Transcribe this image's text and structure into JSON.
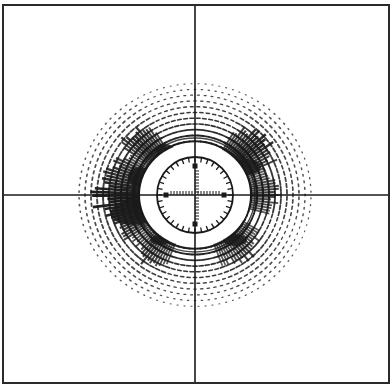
{
  "figure": {
    "colors": {
      "background": "#ffffff",
      "ink": "#1a1a1a",
      "frame": "#2a2a2a"
    },
    "frame": {
      "left": 3,
      "top": 5,
      "right": 389,
      "bottom": 383
    },
    "crosshair": {
      "x": 195,
      "y": 195
    },
    "reticle": {
      "center_x": 195,
      "center_y": 195,
      "radius": 38,
      "tick_count": 36,
      "scale_ticks_per_arm": 8,
      "marker_squares": 4
    },
    "rings": {
      "count": 12,
      "inner_radius": 50,
      "outer_radius": 116,
      "vertical_scale": 0.96,
      "dots_per_ring_base": 60
    },
    "dense_regions": [
      {
        "name": "left-cluster",
        "angle_start": 150,
        "angle_end": 215,
        "intensity": 1.0
      },
      {
        "name": "upper-left-cluster",
        "angle_start": 120,
        "angle_end": 150,
        "intensity": 0.8
      },
      {
        "name": "upper-right-cluster",
        "angle_start": 20,
        "angle_end": 60,
        "intensity": 0.85
      },
      {
        "name": "right-cluster",
        "angle_start": -15,
        "angle_end": 20,
        "intensity": 0.6
      },
      {
        "name": "lower-left-cluster",
        "angle_start": 215,
        "angle_end": 250,
        "intensity": 0.6
      },
      {
        "name": "lower-right-cluster",
        "angle_start": 290,
        "angle_end": 330,
        "intensity": 0.55
      }
    ]
  }
}
